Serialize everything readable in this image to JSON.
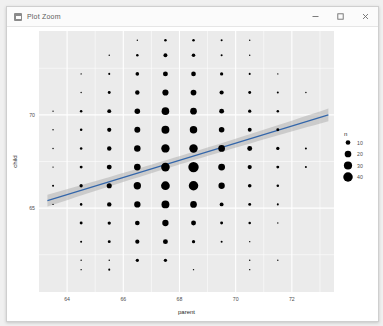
{
  "window": {
    "title": "Plot Zoom",
    "icon": "plot-window-icon",
    "controls": [
      {
        "name": "minimize",
        "glyph": "minimize-icon"
      },
      {
        "name": "maximize",
        "glyph": "maximize-icon"
      },
      {
        "name": "close",
        "glyph": "close-icon"
      }
    ]
  },
  "theme": {
    "panel_bg": "#EBEBEB",
    "grid_major": "#FFFFFF",
    "grid_minor": "#FFFFFF",
    "point_color": "#000000",
    "line_color": "#3366AA",
    "ribbon_color": "#B0B0B0",
    "text_color": "#4D4D4D",
    "plot_bg": "#FFFFFF"
  },
  "chart_data": {
    "type": "scatter",
    "title": "",
    "xlabel": "parent",
    "ylabel": "child",
    "xlim": [
      63.0,
      73.5
    ],
    "ylim": [
      60.5,
      74.5
    ],
    "xticks": [
      64,
      66,
      68,
      70,
      72
    ],
    "yticks": [
      65,
      70
    ],
    "x_minor": [
      65,
      67,
      69,
      71,
      73
    ],
    "y_minor": [
      62.5,
      67.5,
      72.5
    ],
    "grid": true,
    "size_legend": {
      "title": "n",
      "values": [
        10,
        20,
        30,
        40
      ],
      "position": "right"
    },
    "size_range": [
      0.7,
      5.2
    ],
    "size_domain": [
      1,
      48
    ],
    "series": [
      {
        "name": "counts",
        "encoding": "size-by-n",
        "points": [
          {
            "x": 70.5,
            "y": 61.7,
            "n": 1
          },
          {
            "x": 68.5,
            "y": 61.7,
            "n": 1
          },
          {
            "x": 65.5,
            "y": 61.7,
            "n": 2
          },
          {
            "x": 64.5,
            "y": 61.7,
            "n": 1
          },
          {
            "x": 66.5,
            "y": 62.2,
            "n": 5
          },
          {
            "x": 67.5,
            "y": 62.2,
            "n": 5
          },
          {
            "x": 64.5,
            "y": 62.2,
            "n": 1
          },
          {
            "x": 65.5,
            "y": 62.2,
            "n": 1
          },
          {
            "x": 70.5,
            "y": 62.2,
            "n": 1
          },
          {
            "x": 71.5,
            "y": 62.2,
            "n": 1
          },
          {
            "x": 64.5,
            "y": 63.2,
            "n": 2
          },
          {
            "x": 65.5,
            "y": 63.2,
            "n": 4
          },
          {
            "x": 66.5,
            "y": 63.2,
            "n": 8
          },
          {
            "x": 67.5,
            "y": 63.2,
            "n": 11
          },
          {
            "x": 68.5,
            "y": 63.2,
            "n": 5
          },
          {
            "x": 69.5,
            "y": 63.2,
            "n": 2
          },
          {
            "x": 70.5,
            "y": 63.2,
            "n": 1
          },
          {
            "x": 64.5,
            "y": 64.2,
            "n": 4
          },
          {
            "x": 65.5,
            "y": 64.2,
            "n": 5
          },
          {
            "x": 66.5,
            "y": 64.2,
            "n": 10
          },
          {
            "x": 67.5,
            "y": 64.2,
            "n": 18
          },
          {
            "x": 68.5,
            "y": 64.2,
            "n": 11
          },
          {
            "x": 69.5,
            "y": 64.2,
            "n": 4
          },
          {
            "x": 70.5,
            "y": 64.2,
            "n": 3
          },
          {
            "x": 71.5,
            "y": 64.2,
            "n": 1
          },
          {
            "x": 63.5,
            "y": 65.2,
            "n": 1
          },
          {
            "x": 64.5,
            "y": 65.2,
            "n": 3
          },
          {
            "x": 65.5,
            "y": 65.2,
            "n": 9
          },
          {
            "x": 66.5,
            "y": 65.2,
            "n": 18
          },
          {
            "x": 67.5,
            "y": 65.2,
            "n": 28
          },
          {
            "x": 68.5,
            "y": 65.2,
            "n": 20
          },
          {
            "x": 69.5,
            "y": 65.2,
            "n": 7
          },
          {
            "x": 70.5,
            "y": 65.2,
            "n": 4
          },
          {
            "x": 71.5,
            "y": 65.2,
            "n": 2
          },
          {
            "x": 63.5,
            "y": 66.2,
            "n": 2
          },
          {
            "x": 64.5,
            "y": 66.2,
            "n": 5
          },
          {
            "x": 65.5,
            "y": 66.2,
            "n": 12
          },
          {
            "x": 66.5,
            "y": 66.2,
            "n": 24
          },
          {
            "x": 67.5,
            "y": 66.2,
            "n": 34
          },
          {
            "x": 68.5,
            "y": 66.2,
            "n": 40
          },
          {
            "x": 69.5,
            "y": 66.2,
            "n": 18
          },
          {
            "x": 70.5,
            "y": 66.2,
            "n": 6
          },
          {
            "x": 71.5,
            "y": 66.2,
            "n": 3
          },
          {
            "x": 63.5,
            "y": 67.2,
            "n": 1
          },
          {
            "x": 64.5,
            "y": 67.2,
            "n": 4
          },
          {
            "x": 65.5,
            "y": 67.2,
            "n": 11
          },
          {
            "x": 66.5,
            "y": 67.2,
            "n": 20
          },
          {
            "x": 67.5,
            "y": 67.2,
            "n": 33
          },
          {
            "x": 68.5,
            "y": 67.2,
            "n": 48
          },
          {
            "x": 69.5,
            "y": 67.2,
            "n": 21
          },
          {
            "x": 70.5,
            "y": 67.2,
            "n": 8
          },
          {
            "x": 71.5,
            "y": 67.2,
            "n": 4
          },
          {
            "x": 72.5,
            "y": 67.2,
            "n": 2
          },
          {
            "x": 63.5,
            "y": 68.2,
            "n": 1
          },
          {
            "x": 64.5,
            "y": 68.2,
            "n": 3
          },
          {
            "x": 65.5,
            "y": 68.2,
            "n": 9
          },
          {
            "x": 66.5,
            "y": 68.2,
            "n": 19
          },
          {
            "x": 67.5,
            "y": 68.2,
            "n": 31
          },
          {
            "x": 68.5,
            "y": 68.2,
            "n": 32
          },
          {
            "x": 69.5,
            "y": 68.2,
            "n": 20
          },
          {
            "x": 70.5,
            "y": 68.2,
            "n": 11
          },
          {
            "x": 71.5,
            "y": 68.2,
            "n": 5
          },
          {
            "x": 72.5,
            "y": 68.2,
            "n": 2
          },
          {
            "x": 63.5,
            "y": 69.2,
            "n": 1
          },
          {
            "x": 64.5,
            "y": 69.2,
            "n": 3
          },
          {
            "x": 65.5,
            "y": 69.2,
            "n": 8
          },
          {
            "x": 66.5,
            "y": 69.2,
            "n": 16
          },
          {
            "x": 67.5,
            "y": 69.2,
            "n": 28
          },
          {
            "x": 68.5,
            "y": 69.2,
            "n": 25
          },
          {
            "x": 69.5,
            "y": 69.2,
            "n": 14
          },
          {
            "x": 70.5,
            "y": 69.2,
            "n": 7
          },
          {
            "x": 71.5,
            "y": 69.2,
            "n": 4
          },
          {
            "x": 63.5,
            "y": 70.2,
            "n": 1
          },
          {
            "x": 64.5,
            "y": 70.2,
            "n": 3
          },
          {
            "x": 65.5,
            "y": 70.2,
            "n": 7
          },
          {
            "x": 66.5,
            "y": 70.2,
            "n": 14
          },
          {
            "x": 67.5,
            "y": 70.2,
            "n": 26
          },
          {
            "x": 68.5,
            "y": 70.2,
            "n": 20
          },
          {
            "x": 69.5,
            "y": 70.2,
            "n": 11
          },
          {
            "x": 70.5,
            "y": 70.2,
            "n": 5
          },
          {
            "x": 71.5,
            "y": 70.2,
            "n": 3
          },
          {
            "x": 64.5,
            "y": 71.2,
            "n": 1
          },
          {
            "x": 65.5,
            "y": 71.2,
            "n": 4
          },
          {
            "x": 66.5,
            "y": 71.2,
            "n": 9
          },
          {
            "x": 67.5,
            "y": 71.2,
            "n": 17
          },
          {
            "x": 68.5,
            "y": 71.2,
            "n": 15
          },
          {
            "x": 69.5,
            "y": 71.2,
            "n": 8
          },
          {
            "x": 70.5,
            "y": 71.2,
            "n": 4
          },
          {
            "x": 71.5,
            "y": 71.2,
            "n": 2
          },
          {
            "x": 72.5,
            "y": 71.2,
            "n": 1
          },
          {
            "x": 64.5,
            "y": 72.2,
            "n": 1
          },
          {
            "x": 65.5,
            "y": 72.2,
            "n": 2
          },
          {
            "x": 66.5,
            "y": 72.2,
            "n": 6
          },
          {
            "x": 67.5,
            "y": 72.2,
            "n": 11
          },
          {
            "x": 68.5,
            "y": 72.2,
            "n": 10
          },
          {
            "x": 69.5,
            "y": 72.2,
            "n": 5
          },
          {
            "x": 70.5,
            "y": 72.2,
            "n": 2
          },
          {
            "x": 71.5,
            "y": 72.2,
            "n": 1
          },
          {
            "x": 65.5,
            "y": 73.2,
            "n": 1
          },
          {
            "x": 66.5,
            "y": 73.2,
            "n": 3
          },
          {
            "x": 67.5,
            "y": 73.2,
            "n": 7
          },
          {
            "x": 68.5,
            "y": 73.2,
            "n": 6
          },
          {
            "x": 69.5,
            "y": 73.2,
            "n": 2
          },
          {
            "x": 70.5,
            "y": 73.2,
            "n": 1
          },
          {
            "x": 66.5,
            "y": 74.0,
            "n": 1
          },
          {
            "x": 67.5,
            "y": 74.0,
            "n": 3
          },
          {
            "x": 68.5,
            "y": 74.0,
            "n": 3
          },
          {
            "x": 69.5,
            "y": 74.0,
            "n": 2
          },
          {
            "x": 70.5,
            "y": 74.0,
            "n": 1
          }
        ]
      }
    ],
    "smooth": {
      "method": "lm",
      "x_start": 63.3,
      "x_end": 73.3,
      "y_start": 65.4,
      "y_end": 70.0,
      "ci_halfwidth_start": 0.32,
      "ci_halfwidth_mid": 0.12,
      "ci_halfwidth_end": 0.34
    }
  }
}
